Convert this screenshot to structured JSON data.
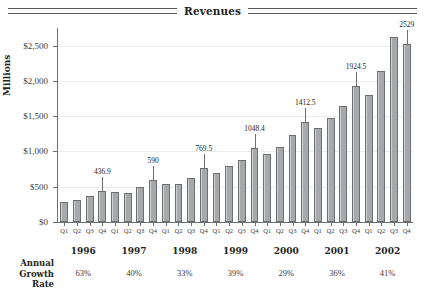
{
  "chart": {
    "title": "Revenues"
  },
  "chart_data": {
    "type": "bar",
    "title": "Revenues",
    "xlabel": "",
    "ylabel": "Millions",
    "ylim": [
      0,
      2750
    ],
    "grid": true,
    "legend": false,
    "ytick_labels": [
      "$0",
      "$500",
      "$1,000",
      "$1,500",
      "$2,000",
      "$2,500"
    ],
    "ytick_values": [
      0,
      500,
      1000,
      1500,
      2000,
      2500
    ],
    "categories": [
      "Q1 1996",
      "Q2 1996",
      "Q3 1996",
      "Q4 1996",
      "Q1 1997",
      "Q2 1997",
      "Q3 1997",
      "Q4 1997",
      "Q1 1998",
      "Q2 1998",
      "Q3 1998",
      "Q4 1998",
      "Q1 1999",
      "Q2 1999",
      "Q3 1999",
      "Q4 1999",
      "Q1 2000",
      "Q2 2000",
      "Q3 2000",
      "Q4 2000",
      "Q1 2001",
      "Q2 2001",
      "Q3 2001",
      "Q4 2001",
      "Q1 2002",
      "Q2 2002",
      "Q3 2002",
      "Q4 2002"
    ],
    "quarter_labels": [
      "Q1",
      "Q2",
      "Q3",
      "Q4",
      "Q1",
      "Q2",
      "Q3",
      "Q4",
      "Q1",
      "Q2",
      "Q3",
      "Q4",
      "Q1",
      "Q2",
      "Q3",
      "Q4",
      "Q1",
      "Q2",
      "Q3",
      "Q4",
      "Q1",
      "Q2",
      "Q3",
      "Q4",
      "Q1",
      "Q2",
      "Q3",
      "Q4"
    ],
    "values": [
      290,
      310,
      370,
      436.9,
      420,
      415,
      500,
      590,
      545,
      540,
      620,
      769.5,
      700,
      790,
      880,
      1048.4,
      960,
      1060,
      1230,
      1412.5,
      1330,
      1470,
      1640,
      1924.5,
      1800,
      2140,
      2620,
      2529
    ],
    "data_labels": [
      {
        "index": 3,
        "text": "436.9"
      },
      {
        "index": 7,
        "text": "590"
      },
      {
        "index": 11,
        "text": "769.5"
      },
      {
        "index": 15,
        "text": "1048.4"
      },
      {
        "index": 19,
        "text": "1412.5"
      },
      {
        "index": 23,
        "text": "1924.5"
      },
      {
        "index": 27,
        "text": "2529"
      }
    ],
    "years": [
      "1996",
      "1997",
      "1998",
      "1999",
      "2000",
      "2001",
      "2002"
    ],
    "annual_growth_label": [
      "Annual",
      "Growth",
      "Rate"
    ],
    "annual_growth_rate": [
      "63%",
      "40%",
      "33%",
      "39%",
      "29%",
      "36%",
      "41%"
    ],
    "colors": {
      "bar_fill": "#a6a8ab",
      "bar_border": "#6d6e70",
      "gridline": "#ececec",
      "axis": "#6d6e70",
      "text": "#231f20"
    }
  }
}
